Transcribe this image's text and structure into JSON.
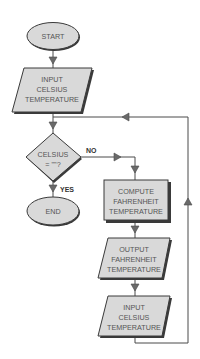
{
  "diagram": {
    "type": "flowchart",
    "nodes": {
      "start": {
        "kind": "terminator",
        "lines": [
          "START"
        ]
      },
      "input1": {
        "kind": "io",
        "lines": [
          "INPUT",
          "CELSIUS",
          "TEMPERATURE"
        ]
      },
      "decision": {
        "kind": "decision",
        "lines": [
          "CELSIUS",
          "= \"\"?"
        ]
      },
      "end": {
        "kind": "terminator",
        "lines": [
          "END"
        ]
      },
      "compute": {
        "kind": "process",
        "lines": [
          "COMPUTE",
          "FAHRENHEIT",
          "TEMPERATURE"
        ]
      },
      "output": {
        "kind": "io",
        "lines": [
          "OUTPUT",
          "FAHRENHEIT",
          "TEMPERATURE"
        ]
      },
      "input2": {
        "kind": "io",
        "lines": [
          "INPUT",
          "CELSIUS",
          "TEMPERATURE"
        ]
      }
    },
    "edges": {
      "yes_label": "YES",
      "no_label": "NO"
    },
    "colors": {
      "fill": "#d9d9d9",
      "stroke": "#3a3a3a",
      "text": "#555555"
    }
  }
}
